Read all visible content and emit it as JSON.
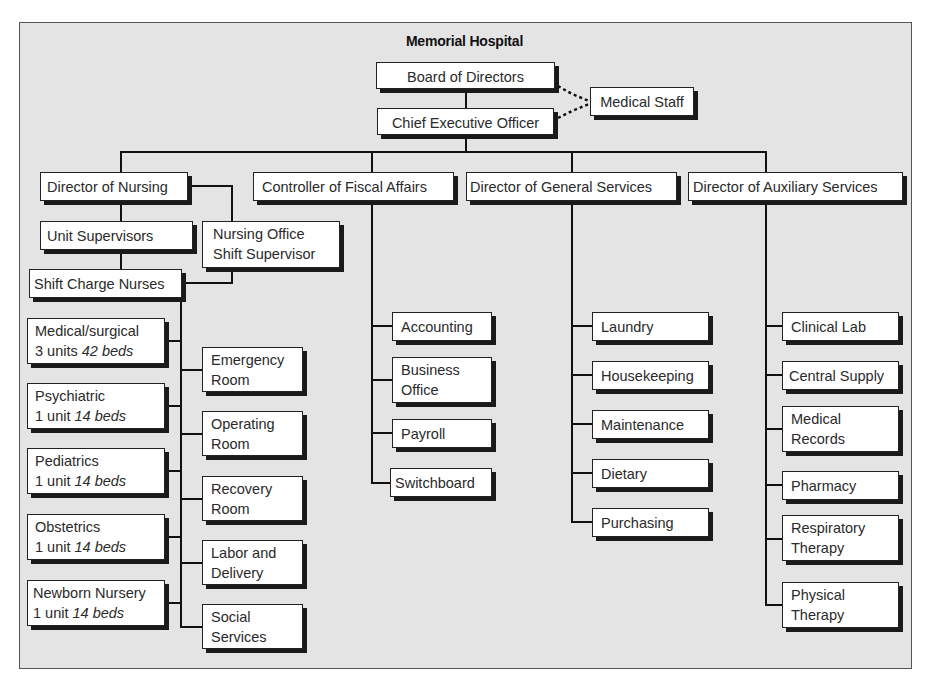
{
  "title": "Memorial Hospital",
  "top": {
    "board": "Board of Directors",
    "ceo": "Chief Executive Officer",
    "medical_staff": "Medical Staff"
  },
  "directors": {
    "nursing": "Director of Nursing",
    "fiscal": "Controller of Fiscal Affairs",
    "general": "Director of General Services",
    "auxiliary": "Director of Auxiliary Services"
  },
  "nursing": {
    "unit_supervisors": "Unit Supervisors",
    "nursing_office_l1": "Nursing Office",
    "nursing_office_l2": "Shift Supervisor",
    "shift_charge": "Shift Charge Nurses",
    "units": [
      {
        "name": "Medical/surgical",
        "units": "3 units",
        "beds": "42 beds"
      },
      {
        "name": "Psychiatric",
        "units": "1 unit",
        "beds": "14 beds"
      },
      {
        "name": "Pediatrics",
        "units": "1 unit",
        "beds": "14 beds"
      },
      {
        "name": "Obstetrics",
        "units": "1 unit",
        "beds": "14 beds"
      },
      {
        "name": "Newborn Nursery",
        "units": "1 unit",
        "beds": "14 beds"
      }
    ],
    "services": [
      {
        "l1": "Emergency",
        "l2": "Room"
      },
      {
        "l1": "Operating",
        "l2": "Room"
      },
      {
        "l1": "Recovery",
        "l2": "Room"
      },
      {
        "l1": "Labor and",
        "l2": "Delivery"
      },
      {
        "l1": "Social",
        "l2": "Services"
      }
    ]
  },
  "fiscal": {
    "items": [
      {
        "l1": "Accounting",
        "l2": ""
      },
      {
        "l1": "Business",
        "l2": "Office"
      },
      {
        "l1": "Payroll",
        "l2": ""
      },
      {
        "l1": "Switchboard",
        "l2": ""
      }
    ]
  },
  "general": {
    "items": [
      "Laundry",
      "Housekeeping",
      "Maintenance",
      "Dietary",
      "Purchasing"
    ]
  },
  "auxiliary": {
    "items": [
      {
        "l1": "Clinical Lab",
        "l2": ""
      },
      {
        "l1": "Central Supply",
        "l2": ""
      },
      {
        "l1": "Medical",
        "l2": "Records"
      },
      {
        "l1": "Pharmacy",
        "l2": ""
      },
      {
        "l1": "Respiratory",
        "l2": "Therapy"
      },
      {
        "l1": "Physical",
        "l2": "Therapy"
      }
    ]
  },
  "colors": {
    "background": "#e4e4e4",
    "box": "#ffffff",
    "line": "#111111",
    "shadow": "#1a1a1a"
  }
}
